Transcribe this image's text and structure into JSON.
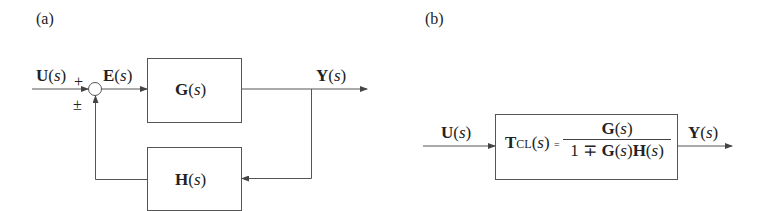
{
  "panel_a": {
    "label": "(a)",
    "input": {
      "bold": "U",
      "open": "(",
      "var": "s",
      "close": ")"
    },
    "plus_sign": "+",
    "pm_sign": "±",
    "error": {
      "bold": "E",
      "open": "(",
      "var": "s",
      "close": ")"
    },
    "forward_block": {
      "bold": "G",
      "open": "(",
      "var": "s",
      "close": ")"
    },
    "feedback_block": {
      "bold": "H",
      "open": "(",
      "var": "s",
      "close": ")"
    },
    "output": {
      "bold": "Y",
      "open": "(",
      "var": "s",
      "close": ")"
    }
  },
  "panel_b": {
    "label": "(b)",
    "input": {
      "bold": "U",
      "open": "(",
      "var": "s",
      "close": ")"
    },
    "output": {
      "bold": "Y",
      "open": "(",
      "var": "s",
      "close": ")"
    },
    "transfer": {
      "lhs_bold": "T",
      "lhs_sub": "CL",
      "lhs_open": "(",
      "lhs_var": "s",
      "lhs_close": ")",
      "equals": "=",
      "numerator": {
        "bold": "G",
        "open": "(",
        "var": "s",
        "close": ")"
      },
      "denominator": {
        "one": "1 ∓ ",
        "g_bold": "G",
        "g_open": "(",
        "g_var": "s",
        "g_close": ")",
        "h_bold": "H",
        "h_open": "(",
        "h_var": "s",
        "h_close": ")"
      }
    }
  },
  "colors": {
    "line": "#444444",
    "text": "#222222",
    "background": "#ffffff"
  }
}
